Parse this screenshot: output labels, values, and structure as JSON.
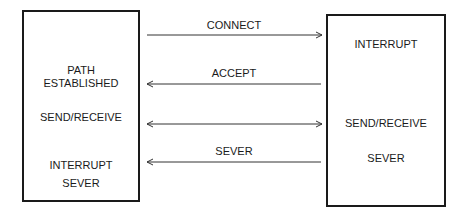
{
  "left_node": {
    "labels": [
      "PATH",
      "ESTABLISHED",
      "SEND/RECEIVE",
      "INTERRUPT",
      "SEVER"
    ]
  },
  "right_node": {
    "labels": [
      "INTERRUPT",
      "SEND/RECEIVE",
      "SEVER"
    ]
  },
  "messages": [
    {
      "label": "CONNECT",
      "direction": "left-to-right"
    },
    {
      "label": "ACCEPT",
      "direction": "right-to-left"
    },
    {
      "label": "",
      "direction": "bidirectional"
    },
    {
      "label": "SEVER",
      "direction": "right-to-left"
    }
  ]
}
